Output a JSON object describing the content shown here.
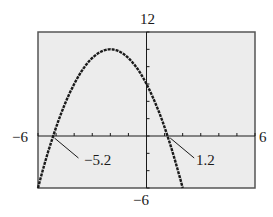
{
  "chart_data": {
    "type": "line",
    "title": "",
    "xlabel": "",
    "ylabel": "",
    "xlim": [
      -6,
      6
    ],
    "ylim": [
      -6,
      12
    ],
    "x_tick_step": 1,
    "y_tick_step": 2,
    "grid": false,
    "legend": null,
    "window_labels": {
      "xmin": "−6",
      "xmax": "6",
      "ymin": "−6",
      "ymax": "12"
    },
    "series": [
      {
        "name": "parabola",
        "equation": "y = -x^2 - 4x + 6",
        "x": [
          -6,
          -5.2,
          -5,
          -4,
          -3,
          -2,
          -1,
          0,
          1,
          1.2,
          2
        ],
        "values": [
          -6,
          0,
          1,
          6,
          9,
          10,
          9,
          6,
          1,
          0,
          -6
        ]
      }
    ],
    "annotations": [
      {
        "text": "−5.2",
        "x": -5.2,
        "y": 0,
        "type": "zero"
      },
      {
        "text": "1.2",
        "x": 1.2,
        "y": 0,
        "type": "zero"
      }
    ]
  },
  "labels": {
    "ymax": "12",
    "ymin": "−6",
    "xmin": "−6",
    "xmax": "6",
    "zero_left": "−5.2",
    "zero_right": "1.2"
  },
  "colors": {
    "screen_bg": "#ececec",
    "ink": "#1a1a1a",
    "frame": "#555555"
  }
}
